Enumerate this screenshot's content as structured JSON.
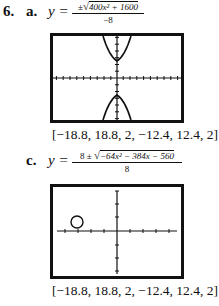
{
  "problem_number": "6.",
  "parts": [
    {
      "label": "a.",
      "y_equals": "y =",
      "numerator": "±√(400x² + 1600)",
      "numerator_prefix": "±",
      "numerator_radicand": "400x² + 1600",
      "denominator": "−8",
      "window": "[−18.8, 18.8, 2, −12.4, 12.4, 2]",
      "graph": "hyperbola-vertical"
    },
    {
      "label": "c.",
      "y_equals": "y =",
      "numerator": "8 ± √(−64x² − 384x − 560)",
      "numerator_prefix": "8 ±",
      "numerator_radicand": "−64x² − 384x − 560",
      "denominator": "8",
      "window": "[−18.8, 18.8, 2, −12.4, 12.4, 2]",
      "graph": "circle"
    }
  ]
}
